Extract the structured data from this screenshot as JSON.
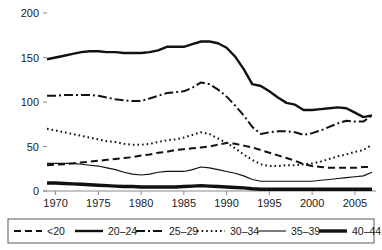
{
  "chart_data": {
    "type": "line",
    "title": "",
    "subtitle": "",
    "xlabel": "",
    "ylabel": "",
    "xlim": [
      1969,
      2007
    ],
    "ylim": [
      0,
      200
    ],
    "grid": false,
    "legend_position": "bottom",
    "x_ticks": [
      "1970",
      "1975",
      "1980",
      "1985",
      "1990",
      "1995",
      "2000",
      "2005"
    ],
    "x_tick_values": [
      1970,
      1975,
      1980,
      1985,
      1990,
      1995,
      2000,
      2005
    ],
    "y_ticks": [
      "0",
      "50",
      "100",
      "150",
      "200"
    ],
    "y_tick_values": [
      0,
      50,
      100,
      150,
      200
    ],
    "x": [
      1969,
      1970,
      1971,
      1972,
      1973,
      1974,
      1975,
      1976,
      1977,
      1978,
      1979,
      1980,
      1981,
      1982,
      1983,
      1984,
      1985,
      1986,
      1987,
      1988,
      1989,
      1990,
      1991,
      1992,
      1993,
      1994,
      1995,
      1996,
      1997,
      1998,
      1999,
      2000,
      2001,
      2002,
      2003,
      2004,
      2005,
      2006,
      2007
    ],
    "series": [
      {
        "name": "<20",
        "label": "<20",
        "style": "dashed",
        "dasharray": "7,4",
        "width": 2.0,
        "color": "#111111",
        "values": [
          29,
          29.5,
          30,
          31,
          32,
          33,
          34,
          35,
          36,
          37,
          38,
          40,
          41,
          43,
          44,
          46,
          47,
          48,
          49,
          50,
          52,
          54,
          53,
          51,
          49,
          46,
          43,
          40,
          37,
          34,
          30,
          28,
          27,
          26,
          26,
          26,
          26,
          27,
          27
        ]
      },
      {
        "name": "20-24",
        "label": "20–24",
        "style": "solid",
        "dasharray": "none",
        "width": 2.4,
        "color": "#111111",
        "values": [
          148,
          150,
          152,
          154,
          156,
          157,
          157,
          156,
          156,
          155,
          155,
          155,
          156,
          158,
          162,
          162,
          162,
          165,
          168,
          168,
          166,
          161,
          151,
          137,
          120,
          118,
          112,
          105,
          99,
          97,
          91,
          91,
          92,
          93,
          94,
          93,
          88,
          83,
          85
        ]
      },
      {
        "name": "25-29",
        "label": "25–29",
        "style": "dashdot",
        "dasharray": "9,3,2,3",
        "width": 2.0,
        "color": "#111111",
        "values": [
          107,
          107,
          108,
          108,
          108,
          108,
          107,
          105,
          103,
          102,
          101,
          101,
          104,
          107,
          110,
          111,
          112,
          116,
          122,
          120,
          114,
          106,
          96,
          85,
          72,
          64,
          66,
          67,
          67,
          66,
          63,
          65,
          68,
          72,
          76,
          79,
          78,
          78,
          85
        ]
      },
      {
        "name": "30-34",
        "label": "30–34",
        "style": "dotted",
        "dasharray": "1.6,3",
        "width": 2.0,
        "color": "#111111",
        "values": [
          70,
          68,
          66,
          64,
          62,
          60,
          58,
          56,
          55,
          53,
          52,
          52,
          53,
          55,
          57,
          58,
          60,
          63,
          66,
          64,
          59,
          54,
          48,
          41,
          35,
          30,
          28,
          28,
          29,
          29,
          30,
          31,
          33,
          36,
          39,
          41,
          44,
          46,
          52
        ]
      },
      {
        "name": "35-39",
        "label": "35–39",
        "style": "thin-solid",
        "dasharray": "none",
        "width": 1.1,
        "color": "#111111",
        "values": [
          31,
          31,
          31,
          31,
          30,
          29,
          28,
          26,
          24,
          21,
          19,
          18,
          19,
          21,
          22,
          22,
          22,
          24,
          27,
          26,
          24,
          22,
          20,
          17,
          13,
          11,
          11,
          11,
          11,
          11,
          11,
          11,
          12,
          13,
          14,
          15,
          16,
          17,
          21
        ]
      },
      {
        "name": "40-44",
        "label": "40–44",
        "style": "thick-solid",
        "dasharray": "none",
        "width": 3.4,
        "color": "#111111",
        "values": [
          9,
          9,
          8.5,
          8,
          7.5,
          7,
          6.5,
          6,
          5.5,
          5,
          5,
          4.5,
          4.5,
          4.5,
          4.5,
          4.5,
          5,
          5.5,
          6,
          5.5,
          5,
          4.5,
          4,
          3.5,
          2.5,
          2,
          2,
          2,
          2,
          2,
          2,
          2,
          2,
          2,
          2,
          2,
          2,
          2,
          2
        ]
      }
    ]
  },
  "legend": {
    "items": [
      {
        "label": "<20"
      },
      {
        "label": "20–24"
      },
      {
        "label": "25–29"
      },
      {
        "label": "30–34"
      },
      {
        "label": "35–39"
      },
      {
        "label": "40–44"
      }
    ]
  }
}
